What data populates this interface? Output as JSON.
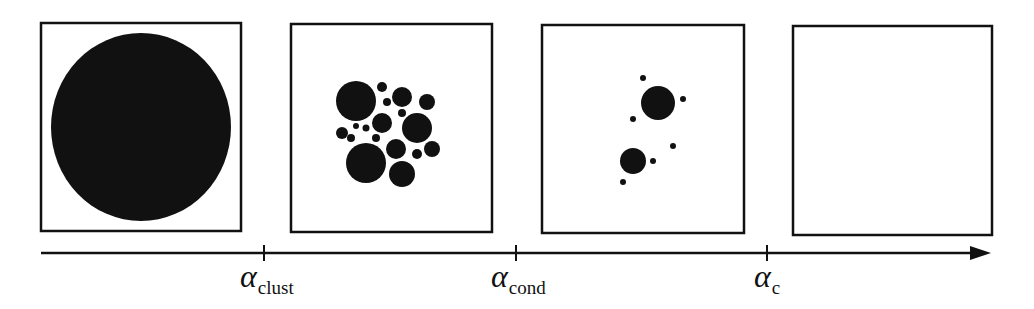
{
  "diagram": {
    "type": "phase-progression",
    "colors": {
      "ink": "#111111",
      "background": "#ffffff"
    },
    "panels": [
      {
        "id": "panel-1",
        "box": {
          "x": 41,
          "y": 23,
          "w": 200,
          "h": 208
        },
        "circles": [
          {
            "cx": 141,
            "cy": 127,
            "rx": 90,
            "ry": 94
          }
        ]
      },
      {
        "id": "panel-2",
        "box": {
          "x": 291,
          "y": 24,
          "w": 201,
          "h": 208
        },
        "circles": [
          {
            "cx": 356,
            "cy": 101,
            "r": 20
          },
          {
            "cx": 382,
            "cy": 87,
            "r": 5
          },
          {
            "cx": 402,
            "cy": 97,
            "r": 10
          },
          {
            "cx": 387,
            "cy": 102,
            "r": 4
          },
          {
            "cx": 427,
            "cy": 102,
            "r": 8
          },
          {
            "cx": 402,
            "cy": 113,
            "r": 4
          },
          {
            "cx": 382,
            "cy": 123,
            "r": 10
          },
          {
            "cx": 417,
            "cy": 128,
            "r": 15
          },
          {
            "cx": 342,
            "cy": 133,
            "r": 6
          },
          {
            "cx": 351,
            "cy": 138,
            "r": 4
          },
          {
            "cx": 356,
            "cy": 126,
            "r": 3
          },
          {
            "cx": 366,
            "cy": 128,
            "r": 3.5
          },
          {
            "cx": 376,
            "cy": 138,
            "r": 4
          },
          {
            "cx": 396,
            "cy": 149,
            "r": 10
          },
          {
            "cx": 417,
            "cy": 154,
            "r": 5
          },
          {
            "cx": 432,
            "cy": 149,
            "r": 8
          },
          {
            "cx": 366,
            "cy": 163,
            "r": 20
          },
          {
            "cx": 402,
            "cy": 174,
            "r": 13
          }
        ]
      },
      {
        "id": "panel-3",
        "box": {
          "x": 542,
          "y": 25,
          "w": 202,
          "h": 208
        },
        "circles": [
          {
            "cx": 658,
            "cy": 103,
            "r": 17
          },
          {
            "cx": 643,
            "cy": 78,
            "r": 3
          },
          {
            "cx": 683,
            "cy": 99,
            "r": 3
          },
          {
            "cx": 633,
            "cy": 119,
            "r": 3
          },
          {
            "cx": 673,
            "cy": 146,
            "r": 3
          },
          {
            "cx": 633,
            "cy": 161,
            "r": 13
          },
          {
            "cx": 653,
            "cy": 161,
            "r": 3
          },
          {
            "cx": 623,
            "cy": 182,
            "r": 3
          }
        ]
      },
      {
        "id": "panel-4",
        "box": {
          "x": 793,
          "y": 26,
          "w": 199,
          "h": 209
        },
        "circles": []
      }
    ],
    "axis": {
      "x1": 41,
      "x2": 970,
      "y": 253,
      "arrowhead": {
        "tip_x": 991,
        "half_height": 7
      },
      "ticks": [
        {
          "x": 264,
          "symbol": "α",
          "subscript": "clust",
          "label_x": 240
        },
        {
          "x": 516,
          "symbol": "α",
          "subscript": "cond",
          "label_x": 491
        },
        {
          "x": 767,
          "symbol": "α",
          "subscript": "c",
          "label_x": 754
        }
      ]
    }
  }
}
